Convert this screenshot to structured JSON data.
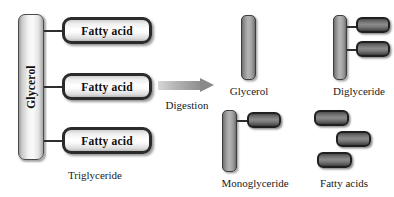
{
  "figure": {
    "background_color": "#ffffff"
  },
  "triglyceride": {
    "backbone_label": "Glycerol",
    "caption": "Triglyceride",
    "fatty_acids": [
      {
        "label": "Fatty acid"
      },
      {
        "label": "Fatty acid"
      },
      {
        "label": "Fatty acid"
      }
    ]
  },
  "process": {
    "arrow_label": "Digestion",
    "arrow_icon": "right-arrow-icon"
  },
  "products": {
    "glycerol": {
      "caption": "Glycerol"
    },
    "diglyceride": {
      "caption": "Diglyceride",
      "chip_count": 2
    },
    "monoglyceride": {
      "caption": "Monoglyceride",
      "chip_count": 1
    },
    "fatty_acids": {
      "caption": "Fatty acids",
      "chip_count": 3
    }
  },
  "colors": {
    "backbone_light": "#f2f2f2",
    "backbone_gray": "#9a9a9a",
    "chip_dark": "#6e6e6e",
    "outline": "#2b2b2b",
    "arrow": "#8e8e8e",
    "text": "#1a1a1a"
  }
}
